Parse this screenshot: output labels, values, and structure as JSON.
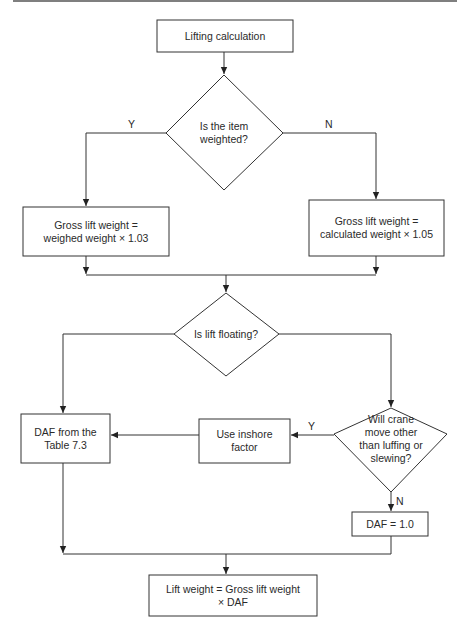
{
  "diagram": {
    "type": "flowchart",
    "nodes": {
      "start": {
        "label": "Lifting calculation",
        "shape": "rect"
      },
      "weighted_decision": {
        "label": "Is the item weighted?",
        "shape": "diamond"
      },
      "gross_weighed": {
        "label": "Gross lift weight = weighed weight × 1.03",
        "shape": "rect"
      },
      "gross_calculated": {
        "label": "Gross lift weight = calculated weight × 1.05",
        "shape": "rect"
      },
      "floating_decision": {
        "label": "Is lift floating?",
        "shape": "diamond"
      },
      "daf_table": {
        "label": "DAF from the Table 7.3",
        "shape": "rect"
      },
      "inshore_factor": {
        "label": "Use inshore factor",
        "shape": "rect"
      },
      "crane_decision": {
        "label": "Will crane move other than luffing or slewing?",
        "shape": "diamond"
      },
      "daf_one": {
        "label": "DAF = 1.0",
        "shape": "rect"
      },
      "lift_weight": {
        "label": "Lift weight = Gross lift weight × DAF",
        "shape": "rect"
      }
    },
    "edge_labels": {
      "weighted_yes": "Y",
      "weighted_no": "N",
      "crane_yes": "Y",
      "crane_no": "N"
    },
    "edges": [
      {
        "from": "start",
        "to": "weighted_decision",
        "label": ""
      },
      {
        "from": "weighted_decision",
        "to": "gross_weighed",
        "label": "Y"
      },
      {
        "from": "weighted_decision",
        "to": "gross_calculated",
        "label": "N"
      },
      {
        "from": "gross_weighed",
        "to": "floating_decision",
        "label": ""
      },
      {
        "from": "gross_calculated",
        "to": "floating_decision",
        "label": ""
      },
      {
        "from": "floating_decision",
        "to": "daf_table",
        "label": ""
      },
      {
        "from": "floating_decision",
        "to": "crane_decision",
        "label": ""
      },
      {
        "from": "crane_decision",
        "to": "inshore_factor",
        "label": "Y"
      },
      {
        "from": "inshore_factor",
        "to": "daf_table",
        "label": ""
      },
      {
        "from": "crane_decision",
        "to": "daf_one",
        "label": "N"
      },
      {
        "from": "daf_table",
        "to": "lift_weight",
        "label": ""
      },
      {
        "from": "daf_one",
        "to": "lift_weight",
        "label": ""
      }
    ],
    "colors": {
      "stroke": "#333333",
      "background": "#ffffff",
      "text": "#2a2a2a"
    }
  },
  "text": {
    "start_line1": "Lifting calculation",
    "weighted_line1": "Is the item",
    "weighted_line2": "weighted?",
    "gross_weighed_line1": "Gross lift weight =",
    "gross_weighed_line2": "weighed weight × 1.03",
    "gross_calc_line1": "Gross lift weight =",
    "gross_calc_line2": "calculated weight × 1.05",
    "floating_line1": "Is lift floating?",
    "daf_table_line1": "DAF from the",
    "daf_table_line2": "Table 7.3",
    "inshore_line1": "Use inshore",
    "inshore_line2": "factor",
    "crane_line1": "Will crane",
    "crane_line2": "move other",
    "crane_line3": "than luffing or",
    "crane_line4": "slewing?",
    "daf_one_line1": "DAF = 1.0",
    "lift_weight_line1": "Lift weight = Gross lift weight",
    "lift_weight_line2": "× DAF"
  }
}
